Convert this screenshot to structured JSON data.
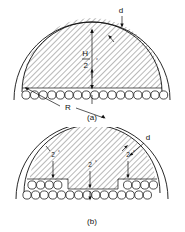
{
  "figure": {
    "panel_a": {
      "caption": "(a)",
      "labels": {
        "wall_thickness": "d",
        "height_symbol": "H",
        "height_divisor": "2",
        "angle_superscript": "°",
        "radius": "R"
      },
      "tube_row_counts": [
        17
      ],
      "hatched_region": "semicircular segment",
      "arc_type": "semicircle",
      "dimension_lines": [
        "d",
        "H",
        "2°",
        "R"
      ]
    },
    "panel_b": {
      "caption": "(b)",
      "labels": {
        "wall_thickness": "d",
        "left_step": "2",
        "left_step_superscript": "°",
        "center_step": "2",
        "center_step_superscript": "°",
        "right_step": "2",
        "right_step_superscript": "°"
      },
      "tube_row_counts": [
        13,
        15
      ],
      "hatched_region": "stepped semicircular segment",
      "arc_type": "semicircle",
      "dimension_lines": [
        "d",
        "2°",
        "2°",
        "2°"
      ]
    }
  },
  "colors": {
    "line": "#111111",
    "background": "#ffffff",
    "hatch": "#111111"
  }
}
